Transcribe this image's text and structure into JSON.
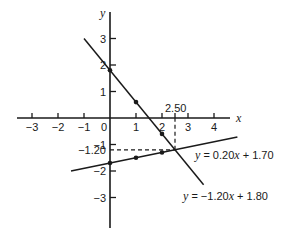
{
  "chart_data": {
    "type": "line",
    "title": "",
    "xlabel": "x",
    "ylabel": "y",
    "xlim": [
      -3.5,
      4.6
    ],
    "ylim": [
      -4.2,
      4.0
    ],
    "grid": false,
    "x_ticks": [
      -3,
      -2,
      -1,
      0,
      1,
      2,
      3,
      4
    ],
    "x_tick_labels": [
      "−3",
      "−2",
      "−1",
      "0",
      "1",
      "2",
      "3",
      "4"
    ],
    "y_ticks": [
      3,
      2,
      1,
      -1,
      -2,
      -3
    ],
    "y_tick_labels": [
      "3",
      "2",
      "1",
      "−1",
      "−2",
      "−3"
    ],
    "series": [
      {
        "name": "y = −1.20x + 1.80",
        "label_prefix": "y",
        "label_rest": " = −1.20",
        "label_var": "x",
        "label_tail": " + 1.80",
        "x_range": [
          -1.0,
          3.6
        ],
        "points": [
          [
            0,
            1.8
          ],
          [
            1,
            0.6
          ],
          [
            2,
            -0.6
          ]
        ]
      },
      {
        "name": "y = 0.20x + 1.70",
        "label_prefix": "y",
        "label_rest": " = 0.20",
        "label_var": "x",
        "label_tail": " + 1.70",
        "x_range": [
          -1.5,
          4.9
        ],
        "points": [
          [
            0,
            -1.7
          ],
          [
            1,
            -1.5
          ],
          [
            2,
            -1.3
          ]
        ]
      }
    ],
    "annotations": [
      {
        "text": "2.50",
        "x": 2.5,
        "y": 0,
        "note": "x-coordinate of intersection"
      },
      {
        "text": "−1.20",
        "x": 0,
        "y": -1.2,
        "note": "y-coordinate of intersection"
      }
    ],
    "intersection": {
      "x": 2.5,
      "y": -1.2
    }
  }
}
